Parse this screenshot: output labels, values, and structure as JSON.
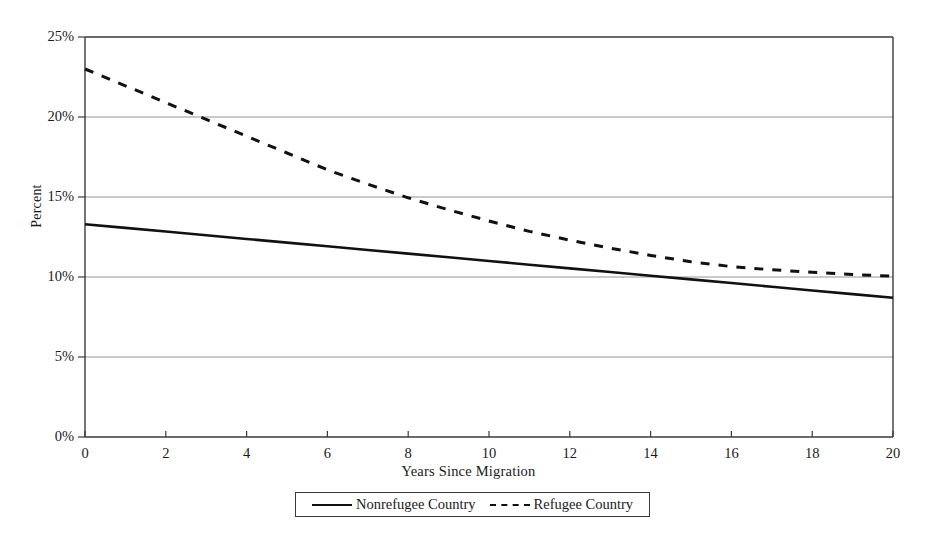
{
  "chart_data": {
    "type": "line",
    "title": "",
    "xlabel": "Years Since Migration",
    "ylabel": "Percent",
    "xlim": [
      0,
      20
    ],
    "ylim": [
      0,
      25
    ],
    "grid": true,
    "grid_axis": "y",
    "legend_position": "bottom",
    "x_ticks": [
      0,
      2,
      4,
      6,
      8,
      10,
      12,
      14,
      16,
      18,
      20
    ],
    "x_tick_labels": [
      "0",
      "2",
      "4",
      "6",
      "8",
      "10",
      "12",
      "14",
      "16",
      "18",
      "20"
    ],
    "y_ticks": [
      0,
      5,
      10,
      15,
      20,
      25
    ],
    "y_tick_labels": [
      "0%",
      "5%",
      "10%",
      "15%",
      "20%",
      "25%"
    ],
    "x": [
      0,
      1,
      2,
      3,
      4,
      5,
      6,
      7,
      8,
      9,
      10,
      11,
      12,
      13,
      14,
      15,
      16,
      17,
      18,
      19,
      20
    ],
    "series": [
      {
        "name": "Nonrefugee Country",
        "style": "solid",
        "color": "#111111",
        "values": [
          13.3,
          13.07,
          12.84,
          12.61,
          12.38,
          12.15,
          11.92,
          11.69,
          11.46,
          11.23,
          11.0,
          10.77,
          10.54,
          10.31,
          10.08,
          9.85,
          9.62,
          9.39,
          9.16,
          8.93,
          8.7
        ]
      },
      {
        "name": "Refugee Country",
        "style": "dashed",
        "color": "#111111",
        "values": [
          23.0,
          21.95,
          20.9,
          19.85,
          18.8,
          17.75,
          16.7,
          15.8,
          14.95,
          14.2,
          13.5,
          12.85,
          12.3,
          11.8,
          11.35,
          10.95,
          10.65,
          10.45,
          10.3,
          10.15,
          10.05
        ]
      }
    ]
  },
  "legend": {
    "entries": [
      {
        "label": "Nonrefugee Country",
        "style": "solid"
      },
      {
        "label": "Refugee Country",
        "style": "dashed"
      }
    ]
  }
}
